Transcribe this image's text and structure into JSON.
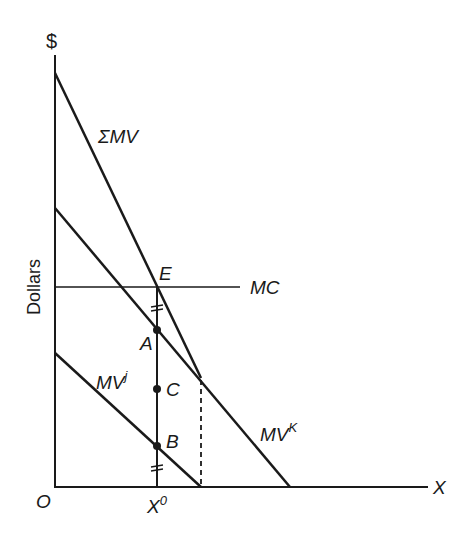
{
  "diagram": {
    "y_axis_label": "Dollars",
    "y_axis_symbol": "$",
    "x_axis_symbol": "X",
    "origin_label": "O",
    "x0_label": "X",
    "x0_sup": "0",
    "curves": {
      "sum_mv": "ΣMV",
      "mv_k_base": "MV",
      "mv_k_sup": "K",
      "mv_j_base": "MV",
      "mv_j_sup": "j",
      "mc": "MC"
    },
    "points": {
      "E": "E",
      "A": "A",
      "B": "B",
      "C": "C"
    },
    "colors": {
      "line": "#1a1a1a",
      "background": "#ffffff"
    }
  }
}
